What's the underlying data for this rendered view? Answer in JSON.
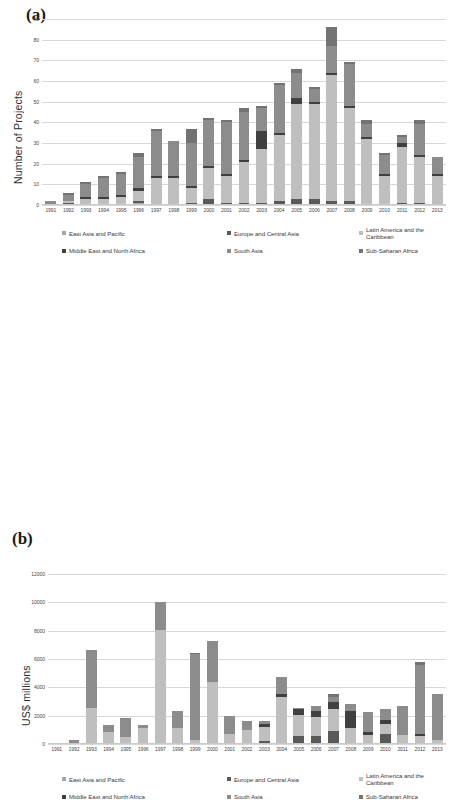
{
  "figure": {
    "panel_a_letter": "(a)",
    "panel_b_letter": "(b)"
  },
  "series_meta": [
    {
      "name": "East Asia and Pacific",
      "color": "#a6a6a6"
    },
    {
      "name": "Europe and Central Asia",
      "color": "#595959"
    },
    {
      "name": "Latin America and the Caribbean",
      "color": "#bfbfbf"
    },
    {
      "name": "Middle East and North Africa",
      "color": "#404040"
    },
    {
      "name": "South Asia",
      "color": "#8c8c8c"
    },
    {
      "name": "Sub-Saharan Africa",
      "color": "#737373"
    }
  ],
  "chart_data": [
    {
      "type": "bar",
      "id": "panel-a",
      "title": "",
      "xlabel": "",
      "ylabel": "Number of Projects",
      "ylim": [
        0,
        90
      ],
      "yticks": [
        0,
        10,
        20,
        30,
        40,
        50,
        60,
        70,
        80,
        90
      ],
      "grid": true,
      "stacked": true,
      "legend_position": "bottom",
      "categories": [
        "1991",
        "1992",
        "1993",
        "1994",
        "1995",
        "1996",
        "1997",
        "1998",
        "1999",
        "2000",
        "2001",
        "2002",
        "2003",
        "2004",
        "2005",
        "2006",
        "2007",
        "2008",
        "2009",
        "2010",
        "2011",
        "2012",
        "2013"
      ],
      "series": [
        {
          "name": "East Asia and Pacific",
          "values": [
            0,
            0,
            0,
            0,
            0,
            1,
            0,
            0,
            0,
            0,
            0,
            0,
            0,
            0,
            0,
            0,
            0,
            0,
            0,
            0,
            0,
            0,
            0
          ]
        },
        {
          "name": "Europe and Central Asia",
          "values": [
            0,
            1,
            0,
            0,
            0,
            1,
            0,
            0,
            1,
            3,
            1,
            1,
            1,
            2,
            3,
            3,
            2,
            2,
            0,
            0,
            1,
            1,
            0
          ]
        },
        {
          "name": "Latin America and the Caribbean",
          "values": [
            0,
            1,
            3,
            3,
            4,
            5,
            13,
            13,
            7,
            15,
            13,
            20,
            26,
            32,
            46,
            46,
            61,
            45,
            32,
            14,
            27,
            22,
            14
          ]
        },
        {
          "name": "Middle East and North Africa",
          "values": [
            0,
            0,
            1,
            1,
            1,
            1,
            1,
            1,
            1,
            1,
            1,
            1,
            9,
            1,
            3,
            1,
            1,
            1,
            1,
            1,
            2,
            1,
            1
          ]
        },
        {
          "name": "South Asia",
          "values": [
            2,
            3,
            6,
            9,
            10,
            15,
            22,
            17,
            21,
            22,
            25,
            23,
            11,
            23,
            12,
            6,
            13,
            20,
            6,
            9,
            3,
            15,
            8
          ]
        },
        {
          "name": "Sub-Saharan Africa",
          "values": [
            0,
            1,
            1,
            1,
            1,
            2,
            1,
            0,
            7,
            1,
            1,
            2,
            1,
            1,
            2,
            1,
            9,
            1,
            2,
            1,
            1,
            2,
            0
          ]
        }
      ],
      "totals": [
        2,
        6,
        11,
        14,
        16,
        25,
        36,
        31,
        36,
        42,
        41,
        47,
        48,
        59,
        66,
        57,
        86,
        69,
        41,
        25,
        34,
        41,
        23
      ]
    },
    {
      "type": "bar",
      "id": "panel-b",
      "title": "",
      "xlabel": "",
      "ylabel": "US$ millions",
      "ylim": [
        0,
        12000
      ],
      "yticks": [
        0,
        2000,
        4000,
        6000,
        8000,
        10000,
        12000
      ],
      "grid": true,
      "stacked": true,
      "legend_position": "bottom",
      "categories": [
        "1991",
        "1992",
        "1993",
        "1994",
        "1995",
        "1996",
        "1997",
        "1998",
        "1999",
        "2000",
        "2001",
        "2002",
        "2003",
        "2004",
        "2005",
        "2006",
        "2007",
        "2008",
        "2009",
        "2010",
        "2011",
        "2012",
        "2013"
      ],
      "series": [
        {
          "name": "East Asia and Pacific",
          "values": [
            0,
            0,
            0,
            0,
            0,
            0,
            0,
            0,
            0,
            0,
            0,
            0,
            0,
            0,
            0,
            0,
            0,
            0,
            0,
            0,
            0,
            0,
            0
          ]
        },
        {
          "name": "Europe and Central Asia",
          "values": [
            0,
            0,
            0,
            0,
            0,
            0,
            0,
            0,
            0,
            0,
            0,
            0,
            200,
            0,
            600,
            600,
            900,
            0,
            0,
            700,
            0,
            0,
            0
          ]
        },
        {
          "name": "Latin America and the Caribbean",
          "values": [
            0,
            0,
            2550,
            870,
            530,
            1150,
            8050,
            1100,
            260,
            4350,
            700,
            1000,
            1000,
            3350,
            1450,
            1300,
            1600,
            1150,
            650,
            700,
            650,
            600,
            250
          ]
        },
        {
          "name": "Middle East and North Africa",
          "values": [
            0,
            0,
            0,
            0,
            0,
            0,
            0,
            0,
            0,
            0,
            0,
            0,
            200,
            200,
            400,
            400,
            500,
            1200,
            200,
            300,
            0,
            100,
            0
          ]
        },
        {
          "name": "South Asia",
          "values": [
            60,
            250,
            4080,
            500,
            1300,
            180,
            1950,
            1250,
            6100,
            2900,
            1250,
            600,
            200,
            1200,
            100,
            350,
            300,
            500,
            1400,
            750,
            2050,
            4850,
            3250
          ]
        },
        {
          "name": "Sub-Saharan Africa",
          "values": [
            0,
            0,
            0,
            0,
            0,
            0,
            0,
            0,
            50,
            0,
            0,
            0,
            0,
            0,
            0,
            0,
            200,
            0,
            0,
            0,
            0,
            250,
            0
          ]
        }
      ],
      "totals": [
        60,
        250,
        6630,
        1370,
        1830,
        1330,
        10000,
        2350,
        6410,
        7250,
        1950,
        1600,
        1600,
        4750,
        2550,
        2650,
        3500,
        2850,
        2250,
        2450,
        2700,
        5800,
        3500
      ]
    }
  ]
}
